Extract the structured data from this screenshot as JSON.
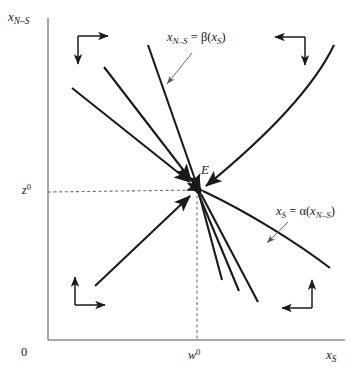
{
  "figure": {
    "type": "phase-diagram",
    "background_color": "#ffffff",
    "line_color": "#1a1a1a",
    "axis_color": "#808080",
    "dashed_color": "#707070",
    "width": 362,
    "height": 381
  },
  "axes": {
    "y_axis_label": "x",
    "y_axis_label_sub": "N–S",
    "x_axis_label": "x",
    "x_axis_label_sub": "S",
    "origin_label": "0",
    "y_tick_label": "z",
    "y_tick_sup": "0",
    "x_tick_label": "w",
    "x_tick_sup": "0",
    "x_range": [
      0,
      362
    ],
    "y_range": [
      0,
      381
    ],
    "origin_px": [
      48,
      340
    ],
    "y_axis_top_px": 18,
    "x_axis_right_px": 345
  },
  "equilibrium": {
    "label": "E",
    "x_px": 197,
    "y_px": 188,
    "x_value_label": "w",
    "y_value_label": "z"
  },
  "curves": [
    {
      "name": "beta-curve",
      "label_x": "x",
      "label_x_sub": "N–S",
      "label_eq": "=",
      "label_fn": "β(",
      "label_arg": "x",
      "label_arg_sub": "S",
      "label_close": ")",
      "label_full": "x_{N–S} = β(x_S)",
      "label_px": [
        168,
        38
      ],
      "pointer_from_px": [
        186,
        53
      ],
      "pointer_to_px": [
        164,
        85
      ],
      "description": "steep downward line through E from upper-left, continuing to lower-right"
    },
    {
      "name": "alpha-curve",
      "label_x": "x",
      "label_x_sub": "S",
      "label_eq": "=",
      "label_fn": "α(",
      "label_arg": "x",
      "label_arg_sub": "N–S",
      "label_close": ")",
      "label_full": "x_S = α(x_{N–S})",
      "label_px": [
        278,
        213
      ],
      "pointer_from_px": [
        276,
        223
      ],
      "pointer_to_px": [
        268,
        243
      ],
      "description": "shallow downward line from E toward lower-right"
    }
  ],
  "trajectory_lines": [
    {
      "name": "traj-upper-left-1",
      "from_px": [
        72,
        88
      ],
      "to_px": [
        196,
        186
      ],
      "arrow_at": "end"
    },
    {
      "name": "traj-upper-left-2",
      "from_px": [
        104,
        67
      ],
      "to_px": [
        196,
        185
      ],
      "arrow_at": "end"
    },
    {
      "name": "traj-upper-left-steep",
      "from_px": [
        148,
        45
      ],
      "to_px": [
        197,
        186
      ],
      "arrow_at": "none"
    },
    {
      "name": "traj-lower-left-rising",
      "from_px": [
        95,
        286
      ],
      "to_px": [
        194,
        191
      ],
      "arrow_at": "end"
    },
    {
      "name": "traj-right-curve",
      "from_px": [
        334,
        45
      ],
      "to_px": [
        203,
        190
      ],
      "arrow_at": "end",
      "curved": true
    },
    {
      "name": "traj-alpha-right",
      "from_px": [
        200,
        190
      ],
      "to_px": [
        330,
        268
      ],
      "arrow_at": "start"
    },
    {
      "name": "traj-lower-right-1",
      "from_px": [
        199,
        192
      ],
      "to_px": [
        258,
        300
      ],
      "arrow_at": "start"
    },
    {
      "name": "traj-lower-right-2",
      "from_px": [
        198,
        192
      ],
      "to_px": [
        238,
        290
      ],
      "arrow_at": "start"
    },
    {
      "name": "traj-lower-right-3",
      "from_px": [
        198,
        192
      ],
      "to_px": [
        222,
        280
      ],
      "arrow_at": "start"
    }
  ],
  "direction_arrows": [
    {
      "name": "quadrant-arrows-top-left",
      "corner_px": [
        78,
        36
      ],
      "horizontal_dir": "right",
      "vertical_dir": "down",
      "h_len": 30,
      "v_len": 28
    },
    {
      "name": "quadrant-arrows-top-right",
      "corner_px": [
        305,
        37
      ],
      "horizontal_dir": "left",
      "vertical_dir": "down",
      "h_len": 30,
      "v_len": 28
    },
    {
      "name": "quadrant-arrows-bottom-left",
      "corner_px": [
        75,
        305
      ],
      "horizontal_dir": "right",
      "vertical_dir": "up",
      "h_len": 30,
      "v_len": 28
    },
    {
      "name": "quadrant-arrows-bottom-right",
      "corner_px": [
        312,
        308
      ],
      "horizontal_dir": "left",
      "vertical_dir": "up",
      "h_len": 30,
      "v_len": 28
    }
  ],
  "dashed_guides": [
    {
      "name": "horizontal-guide-z0",
      "from_px": [
        48,
        194
      ],
      "to_px": [
        197,
        190
      ]
    },
    {
      "name": "vertical-guide-w0",
      "from_px": [
        197,
        190
      ],
      "to_px": [
        197,
        340
      ]
    }
  ]
}
